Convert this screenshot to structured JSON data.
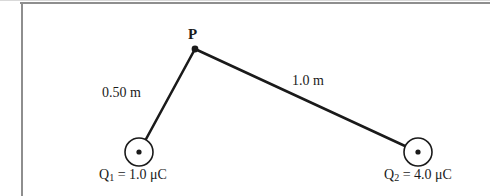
{
  "figure": {
    "type": "physics-diagram",
    "background_color": "#ffffff",
    "stroke_color": "#1a1a1a",
    "frame_color": "#8e8e8e"
  },
  "labels": {
    "point_p": "P",
    "distance_left": "0.50 m",
    "distance_right": "1.0 m",
    "charge_left": "Q",
    "charge_left_sub": "1",
    "charge_left_value": " = 1.0 μC",
    "charge_right": "Q",
    "charge_right_sub": "2",
    "charge_right_value": " = 4.0 μC"
  },
  "geometry": {
    "point_p": {
      "x": 195,
      "y": 49
    },
    "charge1": {
      "cx": 139,
      "cy": 152,
      "r": 14
    },
    "charge2": {
      "cx": 418,
      "cy": 152,
      "r": 14
    },
    "segment_left": {
      "x1": 195,
      "y1": 49,
      "x2": 139,
      "y2": 152,
      "length_label": "0.50 m"
    },
    "segment_right": {
      "x1": 195,
      "y1": 49,
      "x2": 418,
      "y2": 152,
      "length_label": "1.0 m"
    }
  }
}
